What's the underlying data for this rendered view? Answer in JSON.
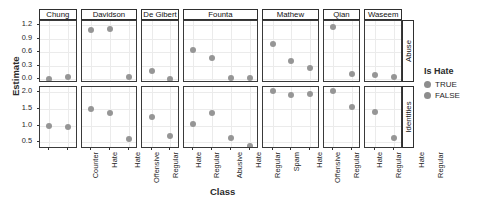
{
  "chart_data": {
    "type": "scatter",
    "title": "",
    "xlabel": "Class",
    "ylabel": "Estimate",
    "legend": {
      "title": "Is Hate",
      "position": "right",
      "entries": [
        {
          "label": "TRUE",
          "color": "#8d8d8d"
        },
        {
          "label": "FALSE",
          "color": "#8d8d8d"
        }
      ]
    },
    "grid": true,
    "facet_columns": [
      "Chung",
      "Davidson",
      "De Gibert",
      "Founta",
      "Mathew",
      "Qian",
      "Waseem"
    ],
    "facet_rows": [
      "Abuse",
      "Identities"
    ],
    "rows": [
      {
        "row": "Abuse",
        "ylim": [
          -0.08,
          1.3
        ],
        "yticks": [
          "0.0",
          "0.3",
          "0.6",
          "0.9",
          "1.2"
        ],
        "ytick_values": [
          0.0,
          0.3,
          0.6,
          0.9,
          1.2
        ],
        "panels": [
          {
            "facet": "Chung",
            "categories": [
              "Counter",
              "Hate"
            ],
            "values": [
              0.01,
              0.05
            ],
            "is_hate": [
              "FALSE",
              "TRUE"
            ]
          },
          {
            "facet": "Davidson",
            "categories": [
              "Hate",
              "Offensive",
              "Regular"
            ],
            "values": [
              1.1,
              1.13,
              0.05
            ],
            "is_hate": [
              "TRUE",
              "FALSE",
              "FALSE"
            ]
          },
          {
            "facet": "De Gibert",
            "categories": [
              "Hate",
              "Regular"
            ],
            "values": [
              0.19,
              0.02
            ],
            "is_hate": [
              "TRUE",
              "FALSE"
            ]
          },
          {
            "facet": "Founta",
            "categories": [
              "Abusive",
              "Hate",
              "Regular",
              "Spam"
            ],
            "values": [
              0.65,
              0.47,
              0.03,
              0.03
            ],
            "is_hate": [
              "FALSE",
              "TRUE",
              "FALSE",
              "FALSE"
            ]
          },
          {
            "facet": "Mathew",
            "categories": [
              "Hate",
              "Offensive",
              "Regular"
            ],
            "values": [
              0.78,
              0.42,
              0.25
            ],
            "is_hate": [
              "TRUE",
              "FALSE",
              "FALSE"
            ]
          },
          {
            "facet": "Qian",
            "categories": [
              "Hate",
              "Regular"
            ],
            "values": [
              1.17,
              0.12
            ],
            "is_hate": [
              "TRUE",
              "FALSE"
            ]
          },
          {
            "facet": "Waseem",
            "categories": [
              "Hate",
              "Regular"
            ],
            "values": [
              0.1,
              0.05
            ],
            "is_hate": [
              "TRUE",
              "FALSE"
            ]
          }
        ]
      },
      {
        "row": "Identities",
        "ylim": [
          0.3,
          2.15
        ],
        "yticks": [
          "0.5",
          "1.0",
          "1.5",
          "2.0"
        ],
        "ytick_values": [
          0.5,
          1.0,
          1.5,
          2.0
        ],
        "panels": [
          {
            "facet": "Chung",
            "categories": [
              "Counter",
              "Hate"
            ],
            "values": [
              1.0,
              0.95
            ],
            "is_hate": [
              "FALSE",
              "TRUE"
            ]
          },
          {
            "facet": "Davidson",
            "categories": [
              "Hate",
              "Offensive",
              "Regular"
            ],
            "values": [
              1.5,
              1.38,
              0.6
            ],
            "is_hate": [
              "TRUE",
              "FALSE",
              "FALSE"
            ]
          },
          {
            "facet": "De Gibert",
            "categories": [
              "Hate",
              "Regular"
            ],
            "values": [
              1.25,
              0.7
            ],
            "is_hate": [
              "TRUE",
              "FALSE"
            ]
          },
          {
            "facet": "Founta",
            "categories": [
              "Abusive",
              "Hate",
              "Regular",
              "Spam"
            ],
            "values": [
              1.05,
              1.38,
              0.62,
              0.4
            ],
            "is_hate": [
              "FALSE",
              "TRUE",
              "FALSE",
              "FALSE"
            ]
          },
          {
            "facet": "Mathew",
            "categories": [
              "Hate",
              "Offensive",
              "Regular"
            ],
            "values": [
              2.02,
              1.9,
              1.95
            ],
            "is_hate": [
              "TRUE",
              "FALSE",
              "FALSE"
            ]
          },
          {
            "facet": "Qian",
            "categories": [
              "Hate",
              "Regular"
            ],
            "values": [
              2.02,
              1.55
            ],
            "is_hate": [
              "TRUE",
              "FALSE"
            ]
          },
          {
            "facet": "Waseem",
            "categories": [
              "Hate",
              "Regular"
            ],
            "values": [
              1.4,
              0.62
            ],
            "is_hate": [
              "TRUE",
              "FALSE"
            ]
          }
        ]
      }
    ]
  }
}
